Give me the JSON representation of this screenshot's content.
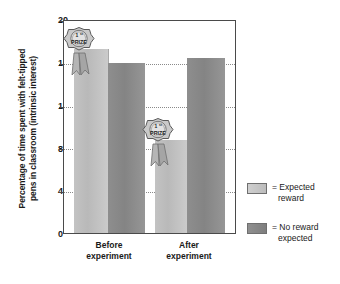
{
  "chart_data": {
    "type": "bar",
    "title": "",
    "xlabel": "",
    "ylabel": "Percentage of time spent with felt-tipped pens in classroom (intrinsic interest)",
    "ylabel_lines": [
      "Percentage of time spent with felt-tipped",
      "pens in classroom (intrinsic interest)"
    ],
    "categories": [
      "Before experiment",
      "After experiment"
    ],
    "category_lines": [
      [
        "Before",
        "experiment"
      ],
      [
        "After",
        "experiment"
      ]
    ],
    "series": [
      {
        "name": "Expected reward",
        "values": [
          17.4,
          8.8
        ],
        "color": "#c3c3c3"
      },
      {
        "name": "No reward expected",
        "values": [
          16.0,
          16.5
        ],
        "color": "#8e8e8e"
      }
    ],
    "ylim": [
      0,
      20
    ],
    "yticks": [
      0,
      4,
      8,
      12,
      16,
      20
    ],
    "ytick_labels": [
      "0",
      "4",
      "8",
      "12",
      "16",
      "20"
    ],
    "grid": "horizontal-dotted",
    "legend_position": "right",
    "annotations": [
      {
        "label": "1st PRIZE",
        "attached_to_bar": 0,
        "type": "prize-ribbon"
      },
      {
        "label": "1st PRIZE",
        "attached_to_bar": 2,
        "type": "prize-ribbon"
      }
    ]
  },
  "legend": {
    "items": [
      {
        "swatch": "light",
        "prefix": "=",
        "line1": "= Expected",
        "line2": "reward"
      },
      {
        "swatch": "dark",
        "prefix": "=",
        "line1": "= No reward",
        "line2": "expected"
      }
    ]
  },
  "medal": {
    "rank": "1",
    "rank_suffix": "st",
    "word": "PRIZE"
  }
}
